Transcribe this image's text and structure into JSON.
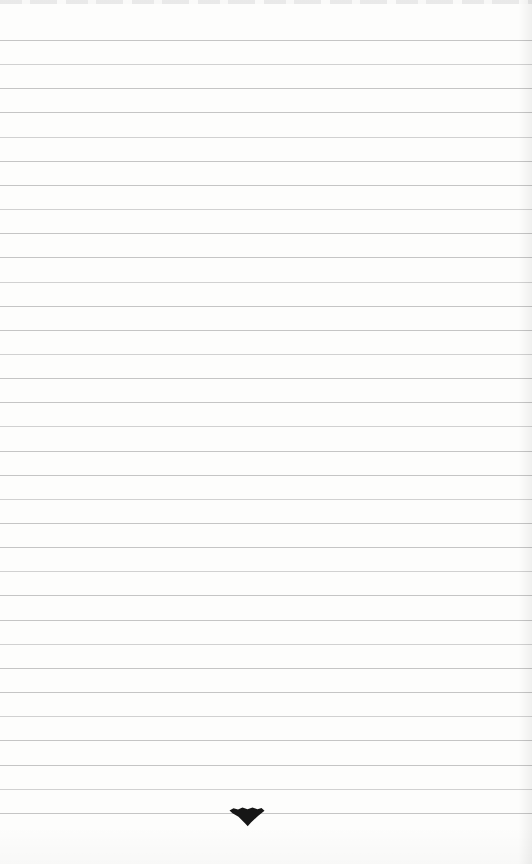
{
  "page": {
    "width": 532,
    "height": 864,
    "colors": {
      "background": "#fdfdfc",
      "rule_line": "#bfbfbf",
      "rule_line_alt": "#cccccc",
      "ornament_ink": "#161616",
      "top_edge_streak": "#e7e7e7"
    },
    "ruled_lines": {
      "count": 33,
      "first_y": 40,
      "spacing": 24.15
    },
    "ornament": {
      "icon": "down-triangle-tailpiece",
      "center_x": 247,
      "top_y": 806,
      "width": 36,
      "height": 21
    }
  }
}
